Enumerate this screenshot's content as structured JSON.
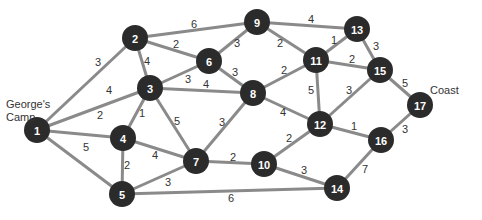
{
  "labels": {
    "start": "George's\nCamp",
    "start_line1": "George's",
    "start_line2": "Camp",
    "end": "Coast"
  },
  "colors": {
    "node": "#2b2b2b",
    "edge": "#8a8a8a",
    "node_text": "#ffffff",
    "weight_text": "#333333"
  },
  "nodes": [
    {
      "id": "1",
      "x": 37,
      "y": 130
    },
    {
      "id": "2",
      "x": 135,
      "y": 38
    },
    {
      "id": "3",
      "x": 150,
      "y": 88
    },
    {
      "id": "4",
      "x": 123,
      "y": 138
    },
    {
      "id": "5",
      "x": 122,
      "y": 194
    },
    {
      "id": "6",
      "x": 209,
      "y": 61
    },
    {
      "id": "7",
      "x": 196,
      "y": 161
    },
    {
      "id": "8",
      "x": 253,
      "y": 93
    },
    {
      "id": "9",
      "x": 257,
      "y": 22
    },
    {
      "id": "10",
      "x": 264,
      "y": 164
    },
    {
      "id": "11",
      "x": 316,
      "y": 60
    },
    {
      "id": "12",
      "x": 320,
      "y": 124
    },
    {
      "id": "13",
      "x": 357,
      "y": 29
    },
    {
      "id": "14",
      "x": 337,
      "y": 188
    },
    {
      "id": "15",
      "x": 380,
      "y": 70
    },
    {
      "id": "16",
      "x": 381,
      "y": 140
    },
    {
      "id": "17",
      "x": 420,
      "y": 105
    }
  ],
  "edges": [
    {
      "from": "1",
      "to": "2",
      "weight": "3",
      "lx": 98,
      "ly": 62
    },
    {
      "from": "1",
      "to": "3",
      "weight": "4",
      "lx": 109,
      "ly": 90
    },
    {
      "from": "1",
      "to": "4",
      "weight": "2",
      "lx": 100,
      "ly": 115
    },
    {
      "from": "1",
      "to": "5",
      "weight": "5",
      "lx": 86,
      "ly": 147
    },
    {
      "from": "2",
      "to": "3",
      "weight": "4",
      "lx": 147,
      "ly": 61
    },
    {
      "from": "2",
      "to": "6",
      "weight": "2",
      "lx": 176,
      "ly": 44
    },
    {
      "from": "2",
      "to": "9",
      "weight": "6",
      "lx": 194,
      "ly": 24
    },
    {
      "from": "3",
      "to": "6",
      "weight": "3",
      "lx": 188,
      "ly": 79
    },
    {
      "from": "3",
      "to": "8",
      "weight": "4",
      "lx": 206,
      "ly": 84
    },
    {
      "from": "3",
      "to": "4",
      "weight": "1",
      "lx": 142,
      "ly": 113
    },
    {
      "from": "3",
      "to": "7",
      "weight": "5",
      "lx": 177,
      "ly": 121
    },
    {
      "from": "4",
      "to": "7",
      "weight": "4",
      "lx": 155,
      "ly": 155
    },
    {
      "from": "4",
      "to": "5",
      "weight": "2",
      "lx": 127,
      "ly": 165
    },
    {
      "from": "5",
      "to": "7",
      "weight": "3",
      "lx": 168,
      "ly": 182
    },
    {
      "from": "5",
      "to": "14",
      "weight": "6",
      "lx": 231,
      "ly": 198
    },
    {
      "from": "6",
      "to": "9",
      "weight": "3",
      "lx": 237,
      "ly": 43
    },
    {
      "from": "6",
      "to": "8",
      "weight": "3",
      "lx": 235,
      "ly": 72
    },
    {
      "from": "7",
      "to": "8",
      "weight": "3",
      "lx": 222,
      "ly": 122
    },
    {
      "from": "7",
      "to": "10",
      "weight": "2",
      "lx": 233,
      "ly": 157
    },
    {
      "from": "8",
      "to": "11",
      "weight": "2",
      "lx": 284,
      "ly": 70
    },
    {
      "from": "8",
      "to": "12",
      "weight": "4",
      "lx": 283,
      "ly": 112
    },
    {
      "from": "9",
      "to": "13",
      "weight": "4",
      "lx": 311,
      "ly": 19
    },
    {
      "from": "9",
      "to": "11",
      "weight": "2",
      "lx": 280,
      "ly": 43
    },
    {
      "from": "11",
      "to": "13",
      "weight": "1",
      "lx": 334,
      "ly": 40
    },
    {
      "from": "11",
      "to": "15",
      "weight": "2",
      "lx": 352,
      "ly": 59
    },
    {
      "from": "11",
      "to": "12",
      "weight": "5",
      "lx": 311,
      "ly": 90
    },
    {
      "from": "12",
      "to": "15",
      "weight": "3",
      "lx": 349,
      "ly": 90
    },
    {
      "from": "12",
      "to": "16",
      "weight": "1",
      "lx": 354,
      "ly": 126
    },
    {
      "from": "12",
      "to": "10",
      "weight": "2",
      "lx": 289,
      "ly": 138
    },
    {
      "from": "10",
      "to": "14",
      "weight": "3",
      "lx": 304,
      "ly": 170
    },
    {
      "from": "13",
      "to": "15",
      "weight": "3",
      "lx": 376,
      "ly": 46
    },
    {
      "from": "15",
      "to": "17",
      "weight": "5",
      "lx": 405,
      "ly": 83
    },
    {
      "from": "16",
      "to": "17",
      "weight": "3",
      "lx": 405,
      "ly": 129
    },
    {
      "from": "14",
      "to": "16",
      "weight": "7",
      "lx": 365,
      "ly": 169
    }
  ]
}
